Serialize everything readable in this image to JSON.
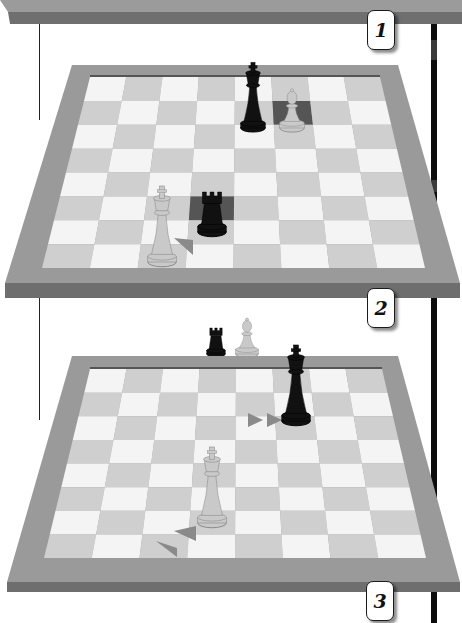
{
  "colors": {
    "frame_top": "#9a9a9a",
    "frame_front": "#6e6e6e",
    "light_square": "#f4f4f4",
    "dark_square": "#cfcfcf",
    "highlight_square": "#555555",
    "arrow": "#8a8a8a",
    "black_piece": "#111111",
    "white_piece": "#c9c9c9",
    "guide_line": "#222222",
    "right_bar": "#0c0c0c"
  },
  "step_labels": [
    {
      "id": "step-1",
      "text": "1"
    },
    {
      "id": "step-2",
      "text": "2"
    },
    {
      "id": "step-3",
      "text": "3"
    }
  ],
  "panels": [
    {
      "step": "1",
      "content": "top shelf edge (board edge of previous panel)"
    },
    {
      "step": "2",
      "board": "8x8",
      "pieces": [
        {
          "type": "king",
          "color": "black",
          "square": "e8"
        },
        {
          "type": "pawn",
          "color": "white",
          "square": "f7",
          "highlighted": true
        },
        {
          "type": "rook",
          "color": "black",
          "square": "d3",
          "highlighted": true
        },
        {
          "type": "king",
          "color": "white",
          "square": "c2"
        }
      ],
      "arrows": [
        {
          "from": "c2",
          "direction": "diagonal toward d2",
          "count": 1
        }
      ]
    },
    {
      "step": "3",
      "captured_pieces": [
        {
          "type": "rook",
          "color": "black"
        },
        {
          "type": "pawn",
          "color": "white"
        }
      ],
      "board": "8x8",
      "pieces": [
        {
          "type": "king",
          "color": "black",
          "square": "g7"
        },
        {
          "type": "king",
          "color": "white",
          "square": "e3"
        }
      ],
      "arrows": [
        {
          "toward": "g7",
          "direction": "right",
          "count": 2
        },
        {
          "toward": "e3",
          "direction": "diagonal up-right",
          "count": 2
        }
      ]
    }
  ]
}
